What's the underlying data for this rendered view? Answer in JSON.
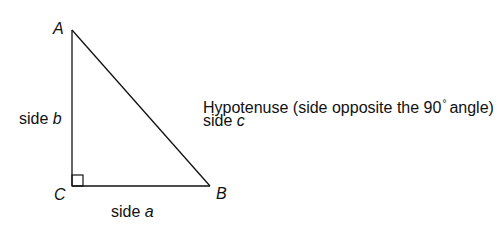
{
  "diagram": {
    "type": "right-triangle",
    "vertices": {
      "A": {
        "label": "A",
        "x": 72,
        "y": 30
      },
      "B": {
        "label": "B",
        "x": 210,
        "y": 186
      },
      "C": {
        "label": "C",
        "x": 72,
        "y": 186
      }
    },
    "right_angle_at": "C",
    "side_labels": {
      "b": {
        "prefix": "side ",
        "letter": "b"
      },
      "a": {
        "prefix": "side ",
        "letter": "a"
      },
      "c": {
        "prefix": "side ",
        "letter": "c"
      }
    },
    "hypotenuse_note": {
      "before": "Hypotenuse (side opposite the 90",
      "degree": "°",
      "after": "angle)"
    },
    "line_color": "#111111"
  }
}
